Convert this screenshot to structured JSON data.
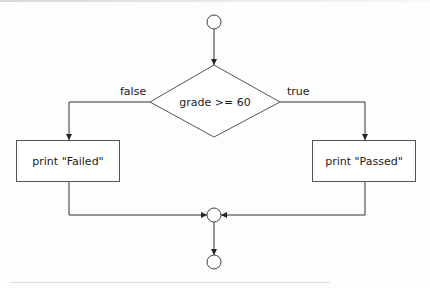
{
  "diagram": {
    "type": "flowchart",
    "style": {
      "stroke_color": "#333333",
      "text_color": "#1a1a1a",
      "background": "#fdfdfd"
    },
    "nodes": [
      {
        "id": "start",
        "kind": "initial-node",
        "label": ""
      },
      {
        "id": "decision",
        "kind": "decision",
        "label": "grade >= 60"
      },
      {
        "id": "failed",
        "kind": "action",
        "label": "print \"Failed\""
      },
      {
        "id": "passed",
        "kind": "action",
        "label": "print \"Passed\""
      },
      {
        "id": "merge",
        "kind": "merge-node",
        "label": ""
      },
      {
        "id": "end",
        "kind": "final-node",
        "label": ""
      }
    ],
    "edges": [
      {
        "from": "start",
        "to": "decision",
        "label": ""
      },
      {
        "from": "decision",
        "to": "failed",
        "label": "false"
      },
      {
        "from": "decision",
        "to": "passed",
        "label": "true"
      },
      {
        "from": "failed",
        "to": "merge",
        "label": ""
      },
      {
        "from": "passed",
        "to": "merge",
        "label": ""
      },
      {
        "from": "merge",
        "to": "end",
        "label": ""
      }
    ],
    "labels": {
      "decision": "grade >= 60",
      "false_branch": "false",
      "true_branch": "true",
      "failed_action": "print \"Failed\"",
      "passed_action": "print \"Passed\""
    }
  }
}
